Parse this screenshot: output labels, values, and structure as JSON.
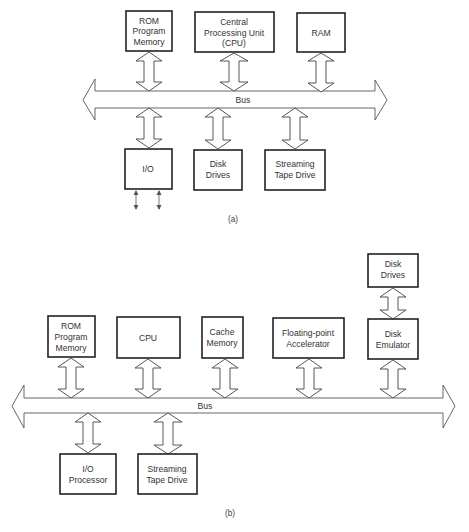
{
  "diagram_a": {
    "caption": "(a)",
    "bus_label": "Bus",
    "top_components": [
      {
        "id": "rom",
        "lines": [
          "ROM",
          "Program",
          "Memory"
        ]
      },
      {
        "id": "cpu",
        "lines": [
          "Central",
          "Processing Unit",
          "(CPU)"
        ]
      },
      {
        "id": "ram",
        "lines": [
          "RAM"
        ]
      }
    ],
    "bottom_components": [
      {
        "id": "io",
        "lines": [
          "I/O"
        ]
      },
      {
        "id": "disk-drives",
        "lines": [
          "Disk",
          "Drives"
        ]
      },
      {
        "id": "streaming-tape",
        "lines": [
          "Streaming",
          "Tape Drive"
        ]
      }
    ]
  },
  "diagram_b": {
    "caption": "(b)",
    "bus_label": "Bus",
    "stacked_component": {
      "id": "disk-drives",
      "lines": [
        "Disk",
        "Drives"
      ]
    },
    "top_components": [
      {
        "id": "rom",
        "lines": [
          "ROM",
          "Program",
          "Memory"
        ]
      },
      {
        "id": "cpu",
        "lines": [
          "CPU"
        ]
      },
      {
        "id": "cache",
        "lines": [
          "Cache",
          "Memory"
        ]
      },
      {
        "id": "fp-accelerator",
        "lines": [
          "Floating-point",
          "Accelerator"
        ]
      },
      {
        "id": "disk-emulator",
        "lines": [
          "Disk",
          "Emulator"
        ]
      }
    ],
    "bottom_components": [
      {
        "id": "io-processor",
        "lines": [
          "I/O",
          "Processor"
        ]
      },
      {
        "id": "streaming-tape",
        "lines": [
          "Streaming",
          "Tape Drive"
        ]
      }
    ]
  }
}
